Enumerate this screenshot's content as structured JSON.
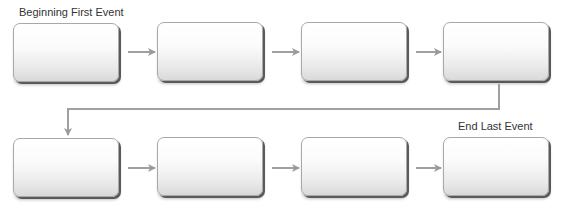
{
  "diagram": {
    "start_label": "Beginning First Event",
    "end_label": "End Last Event",
    "colors": {
      "arrow": "#9a9a9a",
      "box_border": "#a8a8a8",
      "box_shadow": "#5a5a5a",
      "text": "#333333"
    },
    "rows": [
      {
        "boxes": [
          {
            "text": ""
          },
          {
            "text": ""
          },
          {
            "text": ""
          },
          {
            "text": ""
          }
        ]
      },
      {
        "boxes": [
          {
            "text": ""
          },
          {
            "text": ""
          },
          {
            "text": ""
          },
          {
            "text": ""
          }
        ]
      }
    ]
  }
}
